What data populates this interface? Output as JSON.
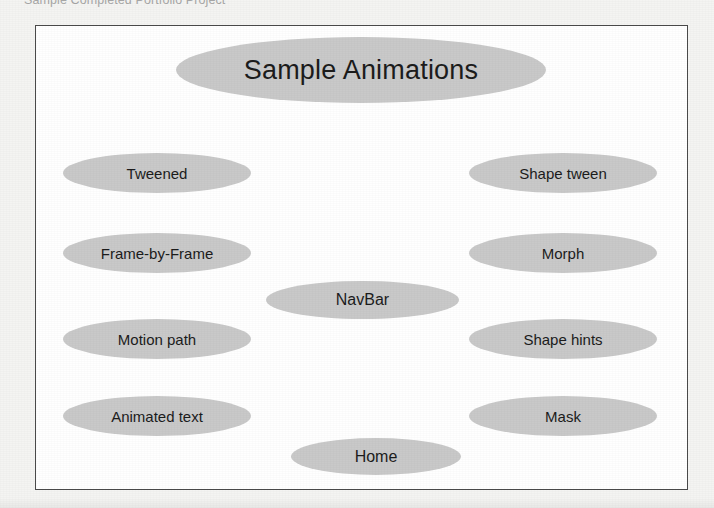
{
  "caption": {
    "text": "Sample Completed Portfolio Project"
  },
  "colors": {
    "node_fill": "#c9c9c9",
    "node_text": "#1c1c1c",
    "frame_border": "#4a4a4a",
    "canvas_background": "#ffffff",
    "page_background": "#f4f4f2",
    "caption_text": "#8d8d8d"
  },
  "diagram": {
    "title_node": {
      "label": "Sample Animations"
    },
    "center_nodes": [
      {
        "label": "NavBar"
      },
      {
        "label": "Home"
      }
    ],
    "left_nodes": [
      {
        "label": "Tweened"
      },
      {
        "label": "Frame-by-Frame"
      },
      {
        "label": "Motion path"
      },
      {
        "label": "Animated text"
      }
    ],
    "right_nodes": [
      {
        "label": "Shape tween"
      },
      {
        "label": "Morph"
      },
      {
        "label": "Shape hints"
      },
      {
        "label": "Mask"
      }
    ]
  }
}
